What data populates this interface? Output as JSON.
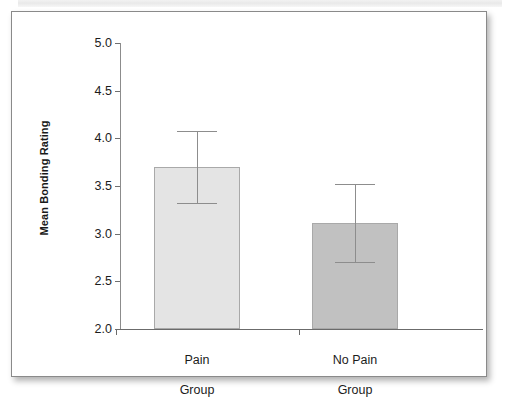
{
  "figure": {
    "frame_color": "#8a8a8a",
    "background": "#ffffff"
  },
  "chart_data": {
    "type": "bar",
    "title": "",
    "subtitle": "",
    "xlabel": "",
    "ylabel": "Mean Bonding Rating",
    "categories": [
      "Pain\nGroup",
      "No Pain\nGroup"
    ],
    "category_lines": [
      [
        "Pain",
        "Group"
      ],
      [
        "No Pain",
        "Group"
      ]
    ],
    "values": [
      3.7,
      3.11
    ],
    "errors": [
      0.38,
      0.41
    ],
    "error_upper": [
      4.08,
      3.52
    ],
    "error_lower": [
      3.32,
      2.7
    ],
    "bar_colors": [
      "#e4e4e4",
      "#c1c1c1"
    ],
    "bar_edge_color": "#a9a9a9",
    "error_bar_color": "#8d8d8d",
    "ylim": [
      2.0,
      5.0
    ],
    "ytick_values": [
      5.0,
      4.5,
      4.0,
      3.5,
      3.0,
      2.5,
      2.0
    ],
    "ytick_labels": [
      "5.0",
      "4.5",
      "4.0",
      "3.5",
      "3.0",
      "2.5",
      "2.0"
    ],
    "ytick_step": 0.5,
    "grid": false,
    "legend": null,
    "legend_position": "none",
    "annotations": []
  },
  "axis": {
    "y_title": "Mean Bonding Rating",
    "ticks": [
      {
        "label": "5.0",
        "value": 5.0
      },
      {
        "label": "4.5",
        "value": 4.5
      },
      {
        "label": "4.0",
        "value": 4.0
      },
      {
        "label": "3.5",
        "value": 3.5
      },
      {
        "label": "3.0",
        "value": 3.0
      },
      {
        "label": "2.5",
        "value": 2.5
      },
      {
        "label": "2.0",
        "value": 2.0
      }
    ]
  },
  "series": [
    {
      "category_line1": "Pain",
      "category_line2": "Group",
      "value": 3.7,
      "error": 0.38,
      "color": "#e4e4e4"
    },
    {
      "category_line1": "No Pain",
      "category_line2": "Group",
      "value": 3.11,
      "error": 0.41,
      "color": "#c1c1c1"
    }
  ]
}
